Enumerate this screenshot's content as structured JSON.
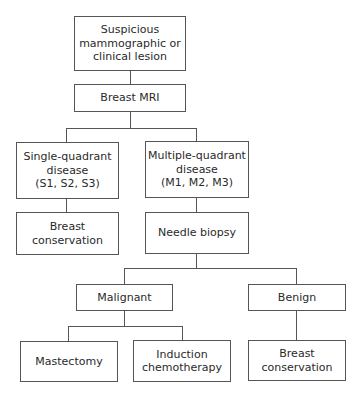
{
  "diagram": {
    "type": "flowchart",
    "nodes": {
      "start": "Suspicious\nmammographic or\nclinical lesion",
      "mri": "Breast MRI",
      "single": "Single-quadrant\ndisease\n(S1, S2, S3)",
      "multiple": "Multiple-quadrant\ndisease\n(M1, M2, M3)",
      "conservation_left": "Breast\nconservation",
      "needle": "Needle biopsy",
      "malignant": "Malignant",
      "benign": "Benign",
      "mastectomy": "Mastectomy",
      "induction": "Induction\nchemotherapy",
      "conservation_right": "Breast\nconservation"
    },
    "edges": [
      [
        "start",
        "mri"
      ],
      [
        "mri",
        "single"
      ],
      [
        "mri",
        "multiple"
      ],
      [
        "single",
        "conservation_left"
      ],
      [
        "multiple",
        "needle"
      ],
      [
        "needle",
        "malignant"
      ],
      [
        "needle",
        "benign"
      ],
      [
        "malignant",
        "mastectomy"
      ],
      [
        "malignant",
        "induction"
      ],
      [
        "benign",
        "conservation_right"
      ]
    ],
    "colors": {
      "line": "#555555",
      "background": "#ffffff",
      "text": "#2a2a2a"
    }
  }
}
